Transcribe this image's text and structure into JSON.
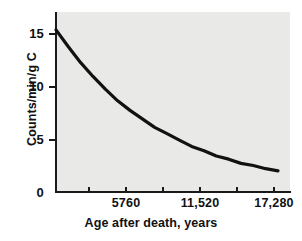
{
  "chart_data": {
    "type": "line",
    "title": "",
    "xlabel": "Age after death, years",
    "ylabel": "Counts/min/g C",
    "xlim": [
      0,
      17280
    ],
    "ylim": [
      0,
      16
    ],
    "grid": false,
    "legend": "none",
    "x_tick_labels": [
      "0",
      "5760",
      "11,520",
      "17,280"
    ],
    "x_tick_values": [
      0,
      5760,
      11520,
      17280
    ],
    "x_minor_tick_values": [
      2880,
      8640,
      14400
    ],
    "y_tick_labels": [
      "0",
      "5",
      "10",
      "15"
    ],
    "y_tick_values": [
      0,
      5,
      10,
      15
    ],
    "curve_color": "#111111",
    "panel_color": "#e9e9e7",
    "series": [
      {
        "name": "Carbon-14 activity",
        "x": [
          0,
          960,
          1920,
          2880,
          3840,
          4800,
          5760,
          6720,
          7680,
          8640,
          9600,
          10560,
          11520,
          12480,
          13440,
          14400,
          15360,
          16320,
          17280
        ],
        "y": [
          15.3,
          13.7,
          12.2,
          10.9,
          9.7,
          8.6,
          7.7,
          6.9,
          6.1,
          5.5,
          4.9,
          4.3,
          3.9,
          3.4,
          3.1,
          2.7,
          2.5,
          2.2,
          2.0
        ]
      }
    ]
  },
  "axes": {
    "y_ticks": [
      {
        "label": "15",
        "value": 15
      },
      {
        "label": "10",
        "value": 10
      },
      {
        "label": "5",
        "value": 5
      },
      {
        "label": "0",
        "value": 0
      }
    ],
    "x_ticks": [
      {
        "label": "5760",
        "value": 5760
      },
      {
        "label": "11,520",
        "value": 11520
      },
      {
        "label": "17,280",
        "value": 17280
      }
    ],
    "x_title": "Age after death, years",
    "y_title": "Counts/min/g C"
  }
}
